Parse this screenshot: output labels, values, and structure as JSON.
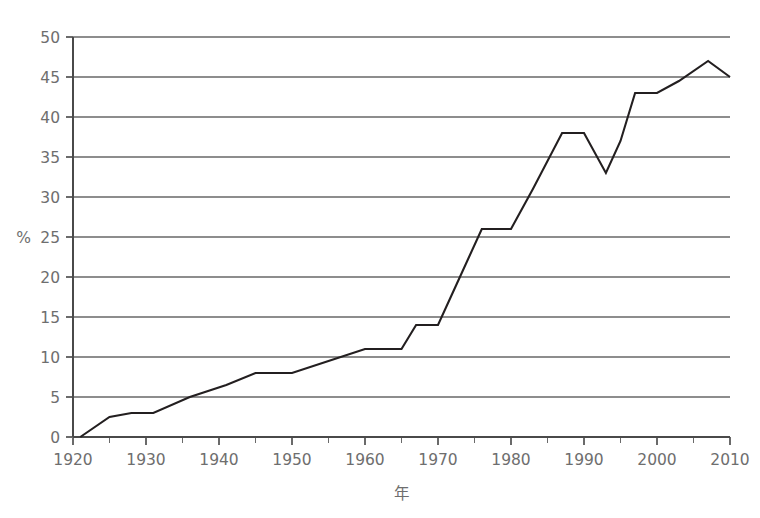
{
  "chart_data": {
    "type": "line",
    "title": "",
    "subtitle": "",
    "xlabel": "年",
    "ylabel": "%",
    "xlim": [
      1918,
      2012
    ],
    "ylim": [
      0,
      50
    ],
    "grid": true,
    "legend_position": "none",
    "x_ticks_major": [
      1920,
      1930,
      1940,
      1950,
      1960,
      1970,
      1980,
      1990,
      2000,
      2010
    ],
    "x_tick_labels": [
      "1920",
      "1930",
      "1940",
      "1950",
      "1960",
      "1970",
      "1980",
      "1990",
      "2000",
      "2010"
    ],
    "x_ticks_minor_interval": 5,
    "y_ticks": [
      0,
      5,
      10,
      15,
      20,
      25,
      30,
      35,
      40,
      45,
      50
    ],
    "y_tick_labels": [
      "0",
      "5",
      "10",
      "15",
      "20",
      "25",
      "30",
      "35",
      "40",
      "45",
      "50"
    ],
    "series": [
      {
        "name": "値",
        "color": "#231f20",
        "x": [
          1921,
          1925,
          1928,
          1931,
          1936,
          1941,
          1945,
          1950,
          1955,
          1960,
          1965,
          1967,
          1970,
          1973,
          1976,
          1980,
          1983,
          1987,
          1990,
          1993,
          1995,
          1997,
          2000,
          2003,
          2007,
          2010
        ],
        "values": [
          0,
          2.5,
          3,
          3,
          5,
          6.5,
          8,
          8,
          9.5,
          11,
          11,
          14,
          14,
          20,
          26,
          26,
          31,
          38,
          38,
          33,
          37,
          43,
          43,
          44.5,
          47,
          45
        ]
      }
    ],
    "annotations": []
  },
  "axis": {
    "y_unit_label": "%",
    "x_axis_title": "年"
  },
  "colors": {
    "line": "#231f20",
    "gridline": "#8d8d8d",
    "axis": "#4a4a4a",
    "text": "#6e6e6e",
    "background": "#ffffff"
  }
}
